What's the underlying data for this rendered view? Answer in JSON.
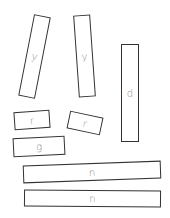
{
  "tiles": [
    {
      "id": "y1",
      "label": "y",
      "cx": 34,
      "cy": 56,
      "w": 17,
      "h": 83,
      "rot": 11
    },
    {
      "id": "y2",
      "label": "y",
      "cx": 84,
      "cy": 56,
      "w": 17,
      "h": 82,
      "rot": -4
    },
    {
      "id": "d",
      "label": "d",
      "cx": 130,
      "cy": 93,
      "w": 18,
      "h": 98,
      "rot": 0
    },
    {
      "id": "r1",
      "label": "r",
      "cx": 32,
      "cy": 120,
      "w": 36,
      "h": 18,
      "rot": -4
    },
    {
      "id": "r2",
      "label": "r",
      "cx": 85,
      "cy": 123,
      "w": 34,
      "h": 18,
      "rot": 12
    },
    {
      "id": "g",
      "label": "g",
      "cx": 39,
      "cy": 146,
      "w": 52,
      "h": 19,
      "rot": -3
    },
    {
      "id": "n1",
      "label": "n",
      "cx": 92,
      "cy": 172,
      "w": 138,
      "h": 18,
      "rot": -2
    },
    {
      "id": "n2",
      "label": "n",
      "cx": 92,
      "cy": 198,
      "w": 137,
      "h": 17,
      "rot": 0.5
    }
  ]
}
